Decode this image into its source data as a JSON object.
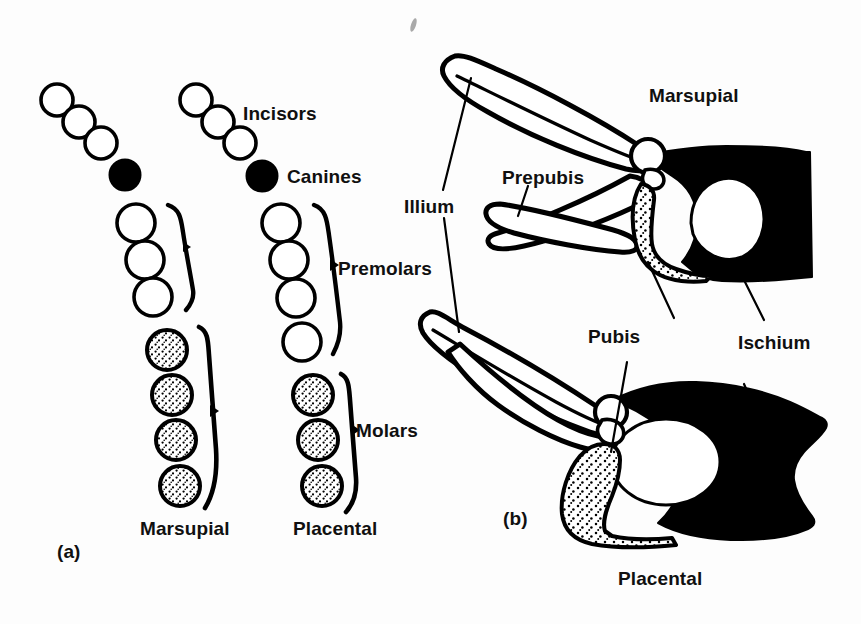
{
  "figure": {
    "background_color": "#fdfdfd",
    "ink_color": "#000000",
    "width": 861,
    "height": 624
  },
  "panel_a": {
    "marker": "(a)",
    "subject": "Dentition comparison",
    "tooth_groups": [
      {
        "name": "Incisors",
        "label": "Incisors"
      },
      {
        "name": "Canines",
        "label": "Canines"
      },
      {
        "name": "Premolars",
        "label": "Premolars"
      },
      {
        "name": "Molars",
        "label": "Molars"
      }
    ],
    "columns": [
      {
        "name": "marsupial-dentition",
        "label": "Marsupial",
        "incisors": 3,
        "canines": 1,
        "premolars": 3,
        "molars": 4
      },
      {
        "name": "placental-dentition",
        "label": "Placental",
        "incisors": 3,
        "canines": 1,
        "premolars": 4,
        "molars": 3
      }
    ],
    "tooth_styles": {
      "open": "outline circle (incisor / premolar)",
      "filled": "solid black circle (canine)",
      "stippled": "stippled circle (molar)"
    }
  },
  "panel_b": {
    "marker": "(b)",
    "subject": "Pelvic girdle comparison",
    "specimens": [
      {
        "name": "marsupial-pelvis",
        "label": "Marsupial"
      },
      {
        "name": "placental-pelvis",
        "label": "Placental"
      }
    ],
    "bone_labels": [
      {
        "name": "illium-label",
        "label": "Illium"
      },
      {
        "name": "prepubis-label",
        "label": "Prepubis"
      },
      {
        "name": "pubis-label",
        "label": "Pubis"
      },
      {
        "name": "ischium-label",
        "label": "Ischium"
      }
    ]
  }
}
